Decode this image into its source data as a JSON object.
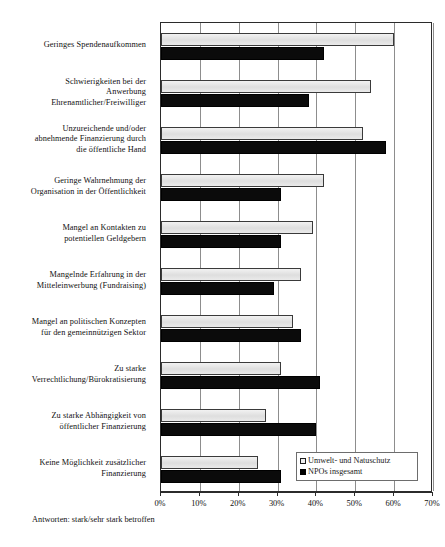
{
  "chart_data": {
    "type": "bar",
    "orientation": "horizontal",
    "title": "",
    "xlabel": "",
    "ylabel": "",
    "xlim": [
      0,
      70
    ],
    "xticks": [
      "0%",
      "10%",
      "20%",
      "30%",
      "40%",
      "50%",
      "60%",
      "70%"
    ],
    "xtick_values": [
      0,
      10,
      20,
      30,
      40,
      50,
      60,
      70
    ],
    "grid": true,
    "legend_position": "bottom-right",
    "categories": [
      "Geringes Spendenaufkommen",
      "Schwierigkeiten bei der Anwerbung Ehrenamtlicher/Freiwilliger",
      "Unzureichende und/oder abnehmende Finanzierung durch die öffentliche Hand",
      "Geringe Wahrnehmung der Organisation in der Öffentlichkeit",
      "Mangel an Kontakten zu potentiellen Geldgebern",
      "Mangelnde Erfahrung in der Mitteleinwerbung (Fundraising)",
      "Mangel an politischen Konzepten für den gemeinnützigen Sektor",
      "Zu starke Verrechtlichung/Bürokratisierung",
      "Zu starke Abhängigkeit von öffentlicher Finanzierung",
      "Keine Möglichkeit zusätzlicher Finanzierung"
    ],
    "category_lines": [
      [
        "Geringes Spendenaufkommen"
      ],
      [
        "Schwierigkeiten bei der",
        "Anwerbung",
        "Ehrenamtlicher/Freiwilliger"
      ],
      [
        "Unzureichende und/oder",
        "abnehmende Finanzierung durch",
        "die öffentliche Hand"
      ],
      [
        "Geringe Wahrnehmung der",
        "Organisation in der Öffentlichkeit"
      ],
      [
        "Mangel an Kontakten zu",
        "potentiellen Geldgebern"
      ],
      [
        "Mangelnde Erfahrung in der",
        "Mitteleinwerbung (Fundraising)"
      ],
      [
        "Mangel an politischen Konzepten",
        "für den gemeinnützigen Sektor"
      ],
      [
        "Zu starke",
        "Verrechtlichung/Bürokratisierung"
      ],
      [
        "Zu starke Abhängigkeit von",
        "öffentlicher Finanzierung"
      ],
      [
        "Keine Möglichkeit zusätzlicher",
        "Finanzierung"
      ]
    ],
    "series": [
      {
        "name": "Umwelt- und Natuschutz",
        "color": "#e3e3e3",
        "values": [
          60,
          54,
          52,
          42,
          39,
          36,
          34,
          31,
          27,
          25
        ]
      },
      {
        "name": "NPOs insgesamt",
        "color": "#0b0b0b",
        "values": [
          42,
          38,
          58,
          31,
          31,
          29,
          36,
          41,
          40,
          31
        ]
      }
    ]
  },
  "legend": {
    "items": [
      {
        "label": "Umwelt- und Natuschutz",
        "swatch": "light"
      },
      {
        "label": "NPOs insgesamt",
        "swatch": "dark"
      }
    ]
  },
  "footnote": {
    "text": "Antworten: stark/sehr stark betroffen"
  }
}
